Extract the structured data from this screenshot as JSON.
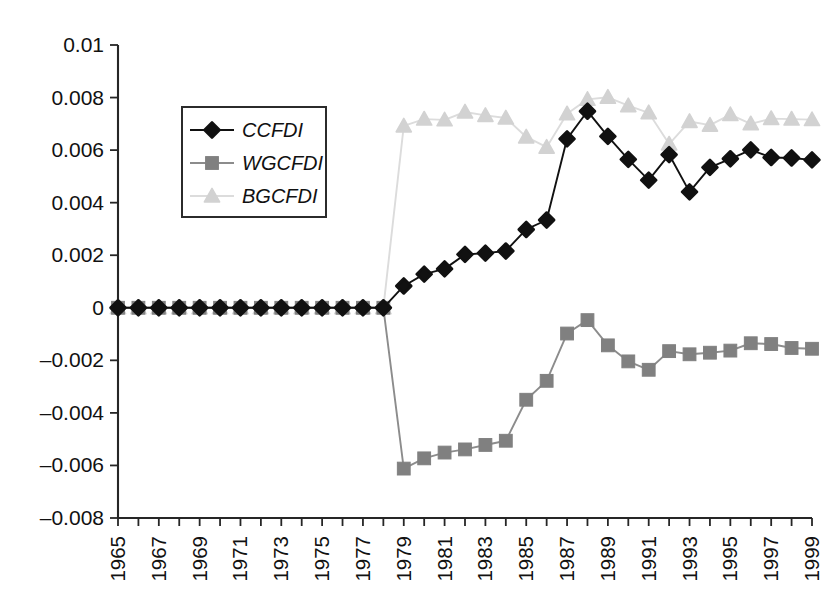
{
  "chart_data": {
    "type": "line",
    "title": "",
    "subtitle": "",
    "xlabel": "",
    "ylabel": "",
    "xlim": [
      1965,
      1999
    ],
    "ylim": [
      -0.008,
      0.01
    ],
    "ytick_step": 0.002,
    "grid": false,
    "legend_position": "upper-left-inside",
    "x": [
      1965,
      1966,
      1967,
      1968,
      1969,
      1970,
      1971,
      1972,
      1973,
      1974,
      1975,
      1976,
      1977,
      1978,
      1979,
      1980,
      1981,
      1982,
      1983,
      1984,
      1985,
      1986,
      1987,
      1988,
      1989,
      1990,
      1991,
      1992,
      1993,
      1994,
      1995,
      1996,
      1997,
      1998,
      1999
    ],
    "xtick_labels": [
      "1965",
      "",
      "1967",
      "",
      "1969",
      "",
      "1971",
      "",
      "1973",
      "",
      "1975",
      "",
      "1977",
      "",
      "1979",
      "",
      "1981",
      "",
      "1983",
      "",
      "1985",
      "",
      "1987",
      "",
      "1989",
      "",
      "1991",
      "",
      "1993",
      "",
      "1995",
      "",
      "1997",
      "",
      "1999"
    ],
    "ytick_labels": [
      "0.01",
      "0.008",
      "0.006",
      "0.004",
      "0.002",
      "0",
      "-0.002",
      "-0.004",
      "-0.006",
      "-0.008"
    ],
    "ytick_values": [
      0.01,
      0.008,
      0.006,
      0.004,
      0.002,
      0,
      -0.002,
      -0.004,
      -0.006,
      -0.008
    ],
    "series": [
      {
        "name": "CCFDI",
        "marker": "diamond",
        "color": "#111111",
        "line_color": "#111111",
        "values": [
          0,
          0,
          0,
          0,
          0,
          0,
          0,
          0,
          0,
          0,
          0,
          0,
          0,
          0,
          0.00083,
          0.00128,
          0.00148,
          0.00203,
          0.00208,
          0.00216,
          0.00298,
          0.00334,
          0.00643,
          0.00748,
          0.00652,
          0.00565,
          0.00486,
          0.00583,
          0.00441,
          0.00534,
          0.00567,
          0.00601,
          0.00572,
          0.0057,
          0.00563
        ]
      },
      {
        "name": "WGCFDI",
        "marker": "square",
        "color": "#808080",
        "line_color": "#8c8c8c",
        "values": [
          0,
          0,
          0,
          0,
          0,
          0,
          0,
          0,
          0,
          0,
          0,
          0,
          0,
          0,
          -0.00612,
          -0.00573,
          -0.00551,
          -0.00539,
          -0.00522,
          -0.00506,
          -0.0035,
          -0.00278,
          -0.00098,
          -0.00047,
          -0.00143,
          -0.00204,
          -0.00236,
          -0.00165,
          -0.00177,
          -0.00171,
          -0.00163,
          -0.00135,
          -0.00138,
          -0.00153,
          -0.00156
        ]
      },
      {
        "name": "BGCFDI",
        "marker": "triangle",
        "color": "#d2d2d2",
        "line_color": "#dcdcdc",
        "values": [
          0,
          0,
          0,
          0,
          0,
          0,
          0,
          0,
          0,
          0,
          0,
          0,
          0,
          0,
          0.00692,
          0.00718,
          0.00715,
          0.00745,
          0.00732,
          0.00722,
          0.0065,
          0.00611,
          0.00738,
          0.00793,
          0.00801,
          0.00769,
          0.00742,
          0.00623,
          0.00709,
          0.00695,
          0.00735,
          0.007,
          0.0072,
          0.00718,
          0.00716
        ]
      }
    ],
    "legend_entries": [
      "CCFDI",
      "WGCFDI",
      "BGCFDI"
    ]
  },
  "colors": {
    "axis": "#262626",
    "background": "#ffffff",
    "series_ccfdi": "#111111",
    "series_wgcfdi": "#808080",
    "series_bgcfdi": "#d2d2d2"
  }
}
